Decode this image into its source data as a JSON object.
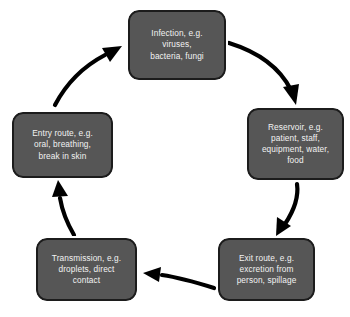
{
  "diagram": {
    "type": "cycle-flowchart",
    "direction": "clockwise",
    "style": {
      "node_fill": "#565656",
      "node_border": "#1c1c1c",
      "node_inner_outline": "#ffffff",
      "node_text_color": "#f2f2f2",
      "arrow_color": "#000000",
      "background": "#ffffff"
    },
    "nodes": [
      {
        "id": "infection",
        "label": "Infection, e.g.\nviruses,\nbacteria, fungi",
        "position": "top"
      },
      {
        "id": "reservoir",
        "label": "Reservoir, e.g.\npatient, staff,\nequipment, water,\nfood",
        "position": "right"
      },
      {
        "id": "exit",
        "label": "Exit route, e.g.\nexcretion from\nperson, spillage",
        "position": "bottom-right"
      },
      {
        "id": "transmission",
        "label": "Transmission, e.g.\ndroplets, direct\ncontact",
        "position": "bottom-left"
      },
      {
        "id": "entry",
        "label": "Entry route, e.g.\noral, breathing,\nbreak in skin",
        "position": "left"
      }
    ],
    "edges": [
      {
        "id": "infection-to-reservoir",
        "from": "infection",
        "to": "reservoir"
      },
      {
        "id": "reservoir-to-exit",
        "from": "reservoir",
        "to": "exit"
      },
      {
        "id": "exit-to-transmission",
        "from": "exit",
        "to": "transmission"
      },
      {
        "id": "transmission-to-entry",
        "from": "transmission",
        "to": "entry"
      },
      {
        "id": "entry-to-infection",
        "from": "entry",
        "to": "infection"
      }
    ]
  }
}
